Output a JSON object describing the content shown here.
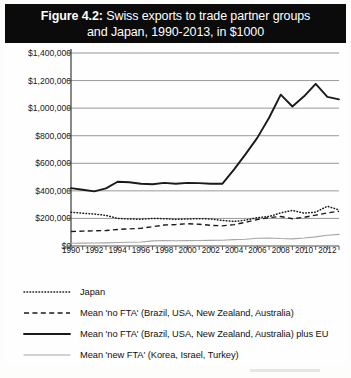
{
  "figure": {
    "label": "Figure 4.2:",
    "title_line1": "Swiss exports to trade partner groups",
    "title_line2": "and Japan, 1990-2013, in $1000"
  },
  "chart_data": {
    "type": "line",
    "title": "Figure 4.2: Swiss exports to trade partner groups and Japan, 1990-2013, in $1000",
    "xlabel": "",
    "ylabel": "",
    "xlim": [
      1990,
      2013
    ],
    "ylim": [
      0,
      1400000
    ],
    "grid": "horizontal",
    "legend_position": "below",
    "x": [
      1990,
      1991,
      1992,
      1993,
      1994,
      1995,
      1996,
      1997,
      1998,
      1999,
      2000,
      2001,
      2002,
      2003,
      2004,
      2005,
      2006,
      2007,
      2008,
      2009,
      2010,
      2011,
      2012,
      2013
    ],
    "y_ticks": [
      0,
      200000,
      400000,
      600000,
      800000,
      1000000,
      1200000,
      1400000
    ],
    "y_tick_labels": [
      "$0",
      "$200,000",
      "$400,000",
      "$600,000",
      "$800,000",
      "$1,000,000",
      "$1,200,000",
      "$1,400,000"
    ],
    "x_tick_labels": [
      "1990",
      "1992",
      "1994",
      "1996",
      "1998",
      "2000",
      "2002",
      "2004",
      "2006",
      "2008",
      "2010",
      "2012"
    ],
    "series": [
      {
        "name": "Japan",
        "style": "dotted",
        "color": "#1a1a1a",
        "values": [
          245000,
          238000,
          232000,
          222000,
          200000,
          196000,
          194000,
          200000,
          198000,
          193000,
          196000,
          198000,
          196000,
          185000,
          178000,
          188000,
          206000,
          214000,
          240000,
          258000,
          238000,
          246000,
          288000,
          262000
        ]
      },
      {
        "name": "Mean 'no FTA' (Brazil, USA, New Zealand, Australia)",
        "style": "dashed",
        "color": "#1a1a1a",
        "values": [
          105000,
          108000,
          110000,
          112000,
          120000,
          124000,
          128000,
          140000,
          152000,
          156000,
          162000,
          158000,
          150000,
          146000,
          155000,
          172000,
          192000,
          206000,
          214000,
          198000,
          208000,
          224000,
          240000,
          252000
        ]
      },
      {
        "name": "Mean 'no FTA' (Brazil, USA, New Zealand, Australia) plus EU",
        "style": "solid-bold",
        "color": "#1a1a1a",
        "values": [
          420000,
          408000,
          396000,
          418000,
          466000,
          462000,
          452000,
          448000,
          458000,
          452000,
          458000,
          456000,
          452000,
          452000,
          556000,
          668000,
          786000,
          930000,
          1098000,
          1012000,
          1086000,
          1176000,
          1082000,
          1064000
        ]
      },
      {
        "name": "Mean 'new FTA' (Korea, Israel, Turkey)",
        "style": "solid-thin",
        "color": "#a6a6a6",
        "values": [
          20000,
          21000,
          22000,
          23000,
          25000,
          27000,
          29000,
          37000,
          40000,
          38000,
          39000,
          40000,
          41000,
          42000,
          46000,
          49000,
          56000,
          58000,
          54000,
          52000,
          58000,
          66000,
          78000,
          84000
        ]
      }
    ]
  },
  "legend": {
    "items": [
      {
        "label": "Japan",
        "style": "dotted"
      },
      {
        "label": "Mean 'no FTA' (Brazil, USA, New Zealand, Australia)",
        "style": "dashed"
      },
      {
        "label": "Mean 'no FTA' (Brazil, USA, New Zealand, Australia) plus EU",
        "style": "solid-bold"
      },
      {
        "label": "Mean 'new FTA' (Korea, Israel, Turkey)",
        "style": "solid-thin"
      }
    ]
  }
}
